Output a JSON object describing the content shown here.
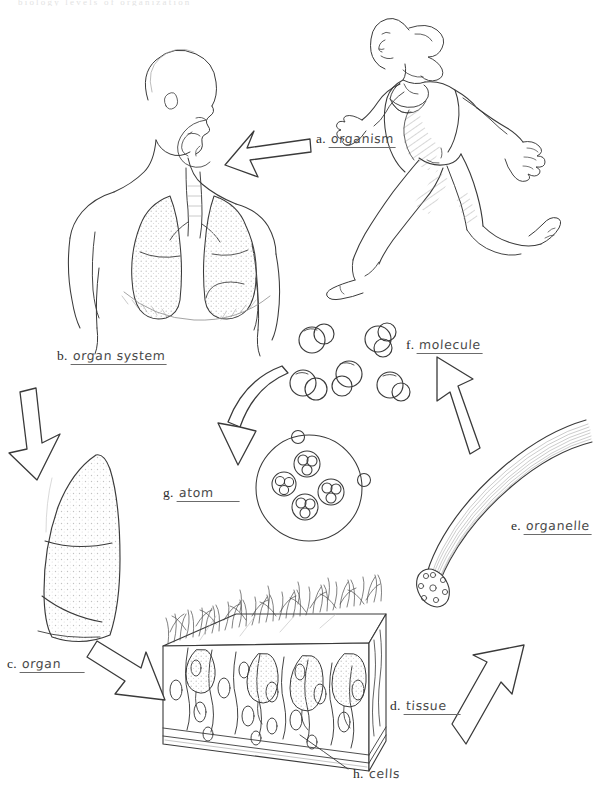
{
  "page": {
    "width": 610,
    "height": 806,
    "background": "#ffffff",
    "ink_color": "#333333",
    "label_color": "#2b2b2b",
    "underline_color": "#6b6b6b",
    "faint_header_text": "biology levels of organization"
  },
  "labels": [
    {
      "key": "a",
      "letter": "a.",
      "word": "organism",
      "x": 316,
      "y": 131
    },
    {
      "key": "b",
      "letter": "b.",
      "word": "organ system",
      "x": 57,
      "y": 348
    },
    {
      "key": "f",
      "letter": "f.",
      "word": "molecule",
      "x": 406,
      "y": 337
    },
    {
      "key": "g",
      "letter": "g.",
      "word": "atom",
      "x": 163,
      "y": 485
    },
    {
      "key": "e",
      "letter": "e.",
      "word": "organelle",
      "x": 511,
      "y": 518
    },
    {
      "key": "c",
      "letter": "c.",
      "word": "organ",
      "x": 7,
      "y": 656
    },
    {
      "key": "d",
      "letter": "d.",
      "word": "tissue",
      "x": 390,
      "y": 698
    },
    {
      "key": "h",
      "letter": "h.",
      "word": "cells",
      "x": 353,
      "y": 766
    }
  ],
  "illustrations": [
    {
      "name": "runner-organism",
      "label_key": "a",
      "description": "Female runner in side view, full body line drawing"
    },
    {
      "name": "respiratory-organ-system",
      "label_key": "b",
      "description": "Human torso showing head, airway, trachea and two stippled lungs"
    },
    {
      "name": "single-lung-organ",
      "label_key": "c",
      "description": "Single stippled lung with lobe fissures"
    },
    {
      "name": "epithelium-tissue-block",
      "label_key": "d",
      "description": "Cube of ciliated pseudostratified columnar epithelium with goblet cells"
    },
    {
      "name": "cilium-organelle",
      "label_key": "e",
      "description": "Curved cilium with cross-section showing microtubule doublets"
    },
    {
      "name": "molecule-cluster",
      "label_key": "f",
      "description": "Five water-like molecules, each two overlapping spheres"
    },
    {
      "name": "atom-diagram",
      "label_key": "g",
      "description": "Atom: outer electron shell, two electrons, nucleus of four nucleon clusters"
    },
    {
      "name": "cells-callout",
      "label_key": "h",
      "description": "Leader line pointing to individual cells inside tissue block"
    }
  ],
  "arrows": [
    {
      "name": "arrow-organism-to-organ-system",
      "from": "a",
      "to": "b",
      "style": "solid-outline",
      "direction": "left"
    },
    {
      "name": "arrow-organ-system-to-organ",
      "from": "b",
      "to": "c",
      "style": "solid-outline",
      "direction": "down"
    },
    {
      "name": "arrow-organ-to-tissue",
      "from": "c",
      "to": "d",
      "style": "solid-outline",
      "direction": "down-right"
    },
    {
      "name": "arrow-tissue-to-organelle",
      "from": "d",
      "to": "e",
      "style": "outline",
      "direction": "up-right"
    },
    {
      "name": "arrow-organelle-to-molecule",
      "from": "e",
      "to": "f",
      "style": "outline",
      "direction": "up-left"
    },
    {
      "name": "arrow-molecule-to-atom",
      "from": "f",
      "to": "g",
      "style": "curved-solid",
      "direction": "down-left"
    }
  ]
}
